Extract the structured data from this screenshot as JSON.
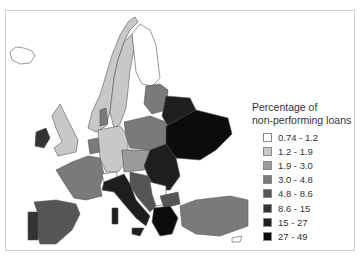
{
  "legend": {
    "title_line1": "Percentage of",
    "title_line2": "non-performing loans",
    "items": [
      {
        "label": "0.74 - 1.2",
        "color": "#ffffff"
      },
      {
        "label": "1.2 - 1.9",
        "color": "#c8c8c8"
      },
      {
        "label": "1.9 - 3.0",
        "color": "#9a9a9a"
      },
      {
        "label": "3.0 - 4.8",
        "color": "#7a7a7a"
      },
      {
        "label": "4.8 - 8.6",
        "color": "#555555"
      },
      {
        "label": "8.6 - 15",
        "color": "#333333"
      },
      {
        "label": "15 - 27",
        "color": "#1e1e1e"
      },
      {
        "label": "27 - 49",
        "color": "#0c0c0c"
      }
    ]
  },
  "map": {
    "subject": "Europe choropleth of non-performing loans",
    "regions": [
      {
        "name": "Iceland",
        "class": "0.74 - 1.2"
      },
      {
        "name": "Norway",
        "class": "1.2 - 1.9"
      },
      {
        "name": "Sweden",
        "class": "1.2 - 1.9"
      },
      {
        "name": "Finland",
        "class": "0.74 - 1.2"
      },
      {
        "name": "United Kingdom",
        "class": "1.2 - 1.9"
      },
      {
        "name": "Ireland",
        "class": "8.6 - 15"
      },
      {
        "name": "Germany",
        "class": "1.2 - 1.9"
      },
      {
        "name": "France",
        "class": "3.0 - 4.8"
      },
      {
        "name": "Spain",
        "class": "4.8 - 8.6"
      },
      {
        "name": "Portugal",
        "class": "8.6 - 15"
      },
      {
        "name": "Italy",
        "class": "15 - 27"
      },
      {
        "name": "Poland",
        "class": "3.0 - 4.8"
      },
      {
        "name": "Ukraine",
        "class": "27 - 49"
      },
      {
        "name": "Belarus",
        "class": "15 - 27"
      },
      {
        "name": "Romania",
        "class": "15 - 27"
      },
      {
        "name": "Greece",
        "class": "27 - 49"
      },
      {
        "name": "Turkey",
        "class": "3.0 - 4.8"
      },
      {
        "name": "Switzerland",
        "class": "0.74 - 1.2"
      }
    ]
  }
}
